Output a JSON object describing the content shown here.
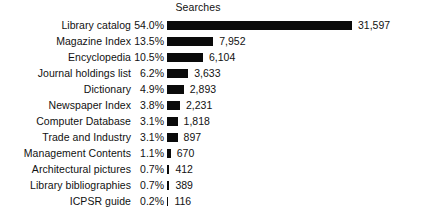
{
  "chart_data": {
    "type": "bar",
    "title": "Searches",
    "xlabel": "",
    "ylabel": "",
    "orientation": "horizontal",
    "grid": false,
    "legend": false,
    "axis_visible": false,
    "xlim": [
      0,
      54.0
    ],
    "bar_color": "#0a0a0a",
    "background_color": "#ffffff",
    "categories": [
      "Library catalog",
      "Magazine Index",
      "Encyclopedia",
      "Journal holdings list",
      "Dictionary",
      "Newspaper Index",
      "Computer Database",
      "Trade and Industry",
      "Management Contents",
      "Architectural pictures",
      "Library bibliographies",
      "ICPSR guide"
    ],
    "percent_labels": [
      "54.0%",
      "13.5%",
      "10.5%",
      "6.2%",
      "4.9%",
      "3.8%",
      "3.1%",
      "3.1%",
      "1.1%",
      "0.7%",
      "0.7%",
      "0.2%"
    ],
    "percent_values": [
      54.0,
      13.5,
      10.5,
      6.2,
      4.9,
      3.8,
      3.1,
      3.1,
      1.1,
      0.7,
      0.7,
      0.2
    ],
    "count_labels": [
      "31,597",
      "7,952",
      "6,104",
      "3,633",
      "2,893",
      "2,231",
      "1,818",
      "897",
      "670",
      "412",
      "389",
      "116"
    ],
    "values": [
      31597,
      7952,
      6104,
      3633,
      2893,
      2231,
      1818,
      897,
      670,
      412,
      389,
      116
    ]
  }
}
